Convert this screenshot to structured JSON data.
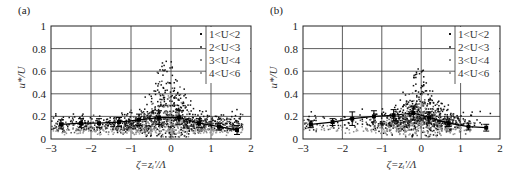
{
  "chart_data": [
    {
      "type": "scatter",
      "panel_label": "(a)",
      "xlabel": "ζ=zᵢ'/Λ",
      "ylabel": "u*/U",
      "xlim": [
        -3,
        2
      ],
      "ylim": [
        0,
        1
      ],
      "xticks": [
        "−3",
        "−2",
        "−1",
        "0",
        "1",
        "2"
      ],
      "yticks": [
        "0",
        "0.2",
        "0.4",
        "0.6",
        "0.8",
        "1"
      ],
      "grid": true,
      "legend_position": "top-right",
      "legend": [
        {
          "label": "1<U<2",
          "color": "#111111"
        },
        {
          "label": "2<U<3",
          "color": "#555555"
        },
        {
          "label": "3<U<4",
          "color": "#8a8a8a"
        },
        {
          "label": "4<U<6",
          "color": "#9e9e9e"
        }
      ],
      "mean_line": {
        "x": [
          -2.75,
          -2.25,
          -1.8,
          -1.3,
          -0.8,
          -0.3,
          0.2,
          0.7,
          1.2,
          1.65
        ],
        "y": [
          0.13,
          0.14,
          0.14,
          0.15,
          0.17,
          0.19,
          0.19,
          0.14,
          0.11,
          0.08
        ],
        "err": [
          0.04,
          0.04,
          0.04,
          0.04,
          0.05,
          0.06,
          0.06,
          0.04,
          0.03,
          0.04
        ]
      },
      "cloud": {
        "peak_x": -0.1,
        "peak_y_max": 0.7,
        "description": "dense scatter peaking near ζ≈0, higher U in lower lighter band"
      }
    },
    {
      "type": "scatter",
      "panel_label": "(b)",
      "xlabel": "ζ=zᵢ'/Λ",
      "ylabel": "u*/U",
      "xlim": [
        -3,
        2
      ],
      "ylim": [
        0,
        1
      ],
      "xticks": [
        "−3",
        "−2",
        "−1",
        "0",
        "1",
        "2"
      ],
      "yticks": [
        "0",
        "0.2",
        "0.4",
        "0.6",
        "0.8",
        "1"
      ],
      "grid": true,
      "legend_position": "top-right",
      "legend": [
        {
          "label": "1<U<2",
          "color": "#111111"
        },
        {
          "label": "2<U<3",
          "color": "#555555"
        },
        {
          "label": "3<U<4",
          "color": "#8a8a8a"
        },
        {
          "label": "4<U<6",
          "color": "#9e9e9e"
        }
      ],
      "mean_line": {
        "x": [
          -2.8,
          -2.25,
          -1.75,
          -1.2,
          -0.7,
          -0.2,
          0.2,
          0.7,
          1.2,
          1.65
        ],
        "y": [
          0.13,
          0.15,
          0.18,
          0.2,
          0.21,
          0.23,
          0.19,
          0.14,
          0.11,
          0.1
        ],
        "err": [
          0.03,
          0.03,
          0.06,
          0.05,
          0.05,
          0.06,
          0.05,
          0.03,
          0.03,
          0.03
        ]
      },
      "cloud": {
        "peak_x": -0.05,
        "peak_y_max": 0.62,
        "description": "sparse on negative side, dense scatter near ζ≈0 to 1"
      }
    }
  ]
}
